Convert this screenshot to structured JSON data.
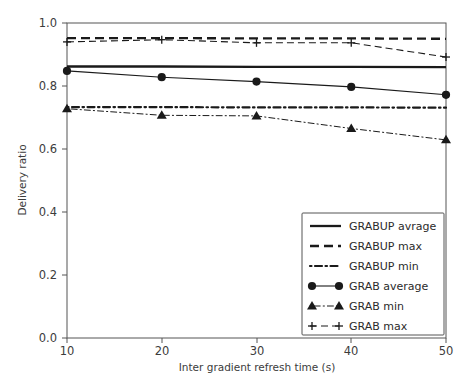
{
  "chart_data": {
    "type": "line",
    "title": "",
    "xlabel": "Inter gradient refresh time (s)",
    "ylabel": "Delivery ratio",
    "x": [
      10,
      20,
      30,
      40,
      50
    ],
    "xlim": [
      10,
      50
    ],
    "ylim": [
      0.0,
      1.0
    ],
    "xticks": [
      "10",
      "20",
      "30",
      "40",
      "50"
    ],
    "yticks": [
      "0.0",
      "0.2",
      "0.4",
      "0.6",
      "0.8",
      "1.0"
    ],
    "grid": false,
    "legend_position": "lower right",
    "series": [
      {
        "name": "GRABUP avrage",
        "values": [
          0.862,
          0.862,
          0.861,
          0.861,
          0.86
        ],
        "style": "solid",
        "marker": "none",
        "color": "#1a1a1a"
      },
      {
        "name": "GRABUP max",
        "values": [
          0.952,
          0.952,
          0.951,
          0.951,
          0.95
        ],
        "style": "dashed",
        "marker": "none",
        "color": "#1a1a1a"
      },
      {
        "name": "GRABUP min",
        "values": [
          0.733,
          0.733,
          0.732,
          0.732,
          0.731
        ],
        "style": "dashdot",
        "marker": "none",
        "color": "#1a1a1a"
      },
      {
        "name": "GRAB average",
        "values": [
          0.848,
          0.828,
          0.814,
          0.797,
          0.772
        ],
        "style": "solid-thin",
        "marker": "circle",
        "color": "#1a1a1a"
      },
      {
        "name": "GRAB min",
        "values": [
          0.728,
          0.707,
          0.705,
          0.665,
          0.629
        ],
        "style": "dashdot-thin",
        "marker": "triangle",
        "color": "#1a1a1a"
      },
      {
        "name": "GRAB max",
        "values": [
          0.94,
          0.947,
          0.937,
          0.937,
          0.892
        ],
        "style": "dashed-thin",
        "marker": "plus",
        "color": "#1a1a1a"
      }
    ]
  },
  "axes": {
    "x_tick_values": [
      10,
      20,
      30,
      40,
      50
    ],
    "y_tick_values": [
      0.0,
      0.2,
      0.4,
      0.6,
      0.8,
      1.0
    ]
  },
  "legend": {
    "entries": [
      "GRABUP avrage",
      "GRABUP max",
      "GRABUP min",
      "GRAB average",
      "GRAB min",
      "GRAB max"
    ]
  }
}
